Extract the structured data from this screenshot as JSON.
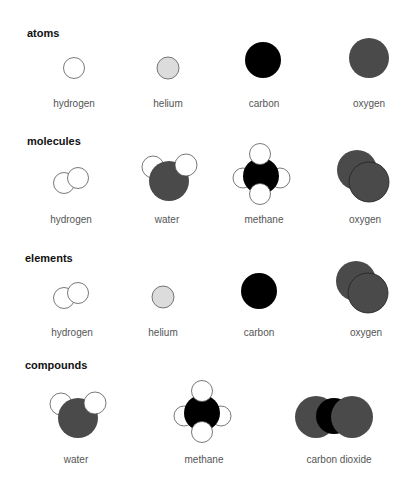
{
  "colors": {
    "hydrogen": "#ffffff",
    "helium": "#dcdcdc",
    "carbon": "#000000",
    "oxygen": "#4a4a4a",
    "outline": "#555555"
  },
  "sections": [
    {
      "heading": "atoms",
      "items": [
        {
          "label": "hydrogen"
        },
        {
          "label": "helium"
        },
        {
          "label": "carbon"
        },
        {
          "label": "oxygen"
        }
      ]
    },
    {
      "heading": "molecules",
      "items": [
        {
          "label": "hydrogen"
        },
        {
          "label": "water"
        },
        {
          "label": "methane"
        },
        {
          "label": "oxygen"
        }
      ]
    },
    {
      "heading": "elements",
      "items": [
        {
          "label": "hydrogen"
        },
        {
          "label": "helium"
        },
        {
          "label": "carbon"
        },
        {
          "label": "oxygen"
        }
      ]
    },
    {
      "heading": "compounds",
      "items": [
        {
          "label": "water"
        },
        {
          "label": "methane"
        },
        {
          "label": "carbon dioxide"
        }
      ]
    }
  ]
}
